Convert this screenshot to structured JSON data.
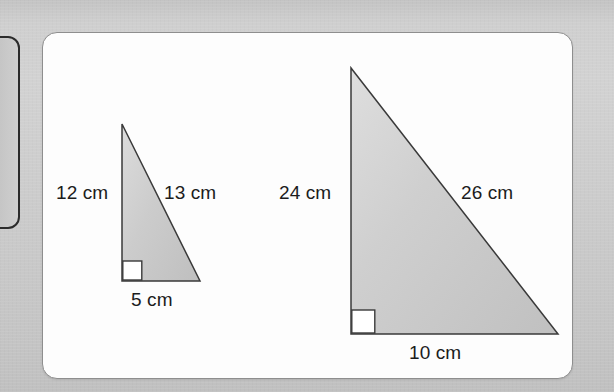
{
  "page": {
    "background_color": "#c9c9c9",
    "card_background_color": "#fdfdfd",
    "card_border_color": "#8e8e8e"
  },
  "left_partial_box": {
    "name": "partial-rounded-box",
    "border_color": "#2b2b2b"
  },
  "figure": {
    "type": "geometry-diagram",
    "triangles": [
      {
        "id": "small-triangle",
        "fill_color": "#c9c9c9",
        "stroke_color": "#3a3a3a",
        "right_angle_marker": true,
        "labels": {
          "vertical_leg": "12 cm",
          "hypotenuse": "13 cm",
          "base_leg": "5 cm"
        },
        "measurements": {
          "vertical_leg": 12,
          "hypotenuse": 13,
          "base_leg": 5,
          "unit": "cm"
        }
      },
      {
        "id": "large-triangle",
        "fill_color": "#c9c9c9",
        "stroke_color": "#3a3a3a",
        "right_angle_marker": true,
        "labels": {
          "vertical_leg": "24 cm",
          "hypotenuse": "26 cm",
          "base_leg": "10 cm"
        },
        "measurements": {
          "vertical_leg": 24,
          "hypotenuse": 26,
          "base_leg": 10,
          "unit": "cm"
        }
      }
    ]
  }
}
